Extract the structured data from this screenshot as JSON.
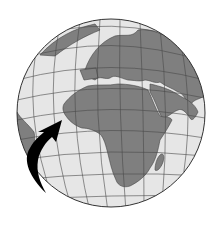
{
  "image": {
    "subject": "globe-illustration",
    "description": "Grayscale globe centered on Africa and Europe with a black curved arrow pointing toward West Africa",
    "colors": {
      "ocean": "#e6e6e6",
      "land": "#7f7f7f",
      "grid": "#4a4a4a",
      "outline": "#333333",
      "arrow": "#000000",
      "background": "#ffffff"
    }
  }
}
